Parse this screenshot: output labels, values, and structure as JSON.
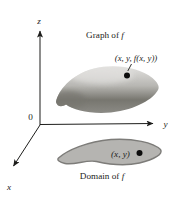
{
  "figure": {
    "labels": {
      "z_axis": "z",
      "y_axis": "y",
      "x_axis": "x",
      "origin": "0",
      "graph_title_prefix": "Graph of ",
      "domain_title_prefix": "Domain of ",
      "f_symbol": "f",
      "graph_point_label": "(x, y, f(x, y))",
      "domain_point_label": "(x, y)"
    },
    "colors": {
      "background": "#ffffff",
      "axis": "#1d1d1b",
      "text": "#1d1d1b",
      "point": "#0d0d0d",
      "surface_top": "#e3e2e0",
      "surface_mid": "#b7b6b2",
      "surface_dark": "#77766f",
      "surface_bottom": "#8b8a85",
      "domain_fill": "#b5b4b1",
      "domain_stroke": "#7d7c79"
    }
  }
}
